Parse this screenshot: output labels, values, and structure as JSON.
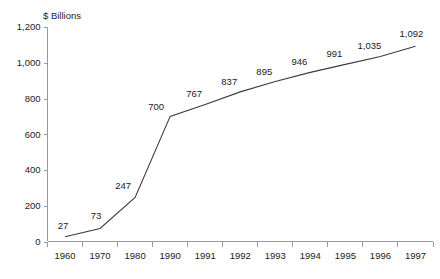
{
  "chart_data": {
    "type": "line",
    "title": "",
    "ylabel": "$ Billions",
    "xlabel": "",
    "categories": [
      "1960",
      "1970",
      "1980",
      "1990",
      "1991",
      "1992",
      "1993",
      "1994",
      "1995",
      "1996",
      "1997"
    ],
    "values": [
      27,
      73,
      247,
      700,
      767,
      837,
      895,
      946,
      991,
      1035,
      1092
    ],
    "point_labels": [
      "27",
      "73",
      "247",
      "700",
      "767",
      "837",
      "895",
      "946",
      "991",
      "1,035",
      "1,092"
    ],
    "ylim": [
      0,
      1200
    ],
    "ytick_values": [
      0,
      200,
      400,
      600,
      800,
      1000,
      1200
    ],
    "ytick_labels": [
      "0",
      "200",
      "400",
      "600",
      "800",
      "1,000",
      "1,200"
    ],
    "grid": false,
    "legend": false,
    "legend_position": "none",
    "series": [
      {
        "name": "",
        "values": [
          27,
          73,
          247,
          700,
          767,
          837,
          895,
          946,
          991,
          1035,
          1092
        ],
        "color": "#3c3c3c"
      }
    ],
    "colors": {
      "line": "#3c3c3c",
      "axis": "#9a9a9a",
      "text": "#222222",
      "background": "#ffffff"
    }
  }
}
